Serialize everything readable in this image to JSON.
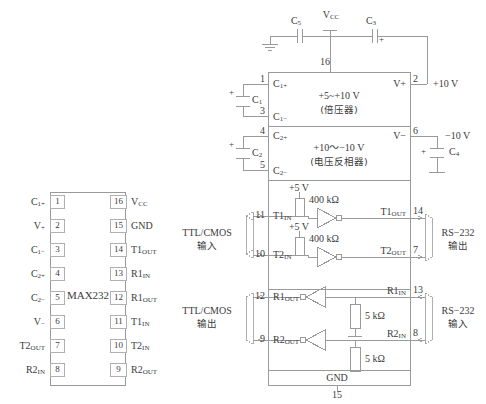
{
  "diagram": {
    "chip_name": "MAX232"
  },
  "pinout": {
    "chip_label": "MAX232",
    "left_pins": [
      {
        "num": "1",
        "name": "C",
        "sub": "1+"
      },
      {
        "num": "2",
        "name": "V",
        "sub": "+"
      },
      {
        "num": "3",
        "name": "C",
        "sub": "1−"
      },
      {
        "num": "4",
        "name": "C",
        "sub": "2+"
      },
      {
        "num": "5",
        "name": "C",
        "sub": "2−"
      },
      {
        "num": "6",
        "name": "V",
        "sub": "−"
      },
      {
        "num": "7",
        "name": "T2",
        "sub": "OUT"
      },
      {
        "num": "8",
        "name": "R2",
        "sub": "IN"
      }
    ],
    "right_pins": [
      {
        "num": "16",
        "name": "V",
        "sub": "CC"
      },
      {
        "num": "15",
        "name": "GND",
        "sub": ""
      },
      {
        "num": "14",
        "name": "T1",
        "sub": "OUT"
      },
      {
        "num": "13",
        "name": "R1",
        "sub": "IN"
      },
      {
        "num": "12",
        "name": "R1",
        "sub": "OUT"
      },
      {
        "num": "11",
        "name": "T1",
        "sub": "IN"
      },
      {
        "num": "10",
        "name": "T2",
        "sub": "IN"
      },
      {
        "num": "9",
        "name": "R2",
        "sub": "OUT"
      }
    ]
  },
  "block": {
    "supply": {
      "c5": "C",
      "c5_sub": "5",
      "vcc": "V",
      "vcc_sub": "CC",
      "c3": "C",
      "c3_sub": "3",
      "c3_polarity": "+",
      "pin16": "16",
      "ground_icon": "ground-symbol"
    },
    "doubler": {
      "pin_top": "1",
      "pin_bottom": "3",
      "label_top": "C",
      "label_top_sub": "1+",
      "label_bottom": "C",
      "label_bottom_sub": "1−",
      "title": "+5~+10 V",
      "subtitle": "(倍压器)",
      "out_label": "V+",
      "out_pin": "2",
      "out_value": "+10 V",
      "cap": "C",
      "cap_sub": "1",
      "cap_polarity": "+"
    },
    "inverter": {
      "pin_top": "4",
      "pin_bottom": "5",
      "label_top": "C",
      "label_top_sub": "2+",
      "label_bottom": "C",
      "label_bottom_sub": "2−",
      "title": "+10～−10 V",
      "subtitle": "(电压反相器)",
      "out_label": "V−",
      "out_pin": "6",
      "out_value": "−10 V",
      "cap": "C",
      "cap_sub": "2",
      "cap_polarity": "+",
      "cap_out": "C",
      "cap_out_sub": "4",
      "cap_out_polarity": "+"
    },
    "transmitters": [
      {
        "in_pin": "11",
        "in_label": "T1",
        "in_sub": "IN",
        "pullup_supply": "+5 V",
        "pullup_value": "400 kΩ",
        "out_label": "T1",
        "out_sub": "OUT",
        "out_pin": "14"
      },
      {
        "in_pin": "10",
        "in_label": "T2",
        "in_sub": "IN",
        "pullup_supply": "+5 V",
        "pullup_value": "400 kΩ",
        "out_label": "T2",
        "out_sub": "OUT",
        "out_pin": "7"
      }
    ],
    "receivers": [
      {
        "out_pin": "12",
        "out_label": "R1",
        "out_sub": "OUT",
        "in_label": "R1",
        "in_sub": "IN",
        "in_pin": "13",
        "resistor_value": "5 kΩ"
      },
      {
        "out_pin": "9",
        "out_label": "R2",
        "out_sub": "OUT",
        "in_label": "R2",
        "in_sub": "IN",
        "in_pin": "8",
        "resistor_value": "5 kΩ"
      }
    ],
    "gnd": {
      "label": "GND",
      "pin": "15"
    },
    "side_labels": {
      "ttl_in_line1": "TTL/CMOS",
      "ttl_in_line2": "输入",
      "ttl_out_line1": "TTL/CMOS",
      "ttl_out_line2": "输出",
      "rs232_out_line1": "RS−232",
      "rs232_out_line2": "输出",
      "rs232_in_line1": "RS−232",
      "rs232_in_line2": "输入"
    }
  },
  "colors": {
    "line": "#9a9a9a",
    "text": "#3b3b3b",
    "background": "#ffffff"
  }
}
